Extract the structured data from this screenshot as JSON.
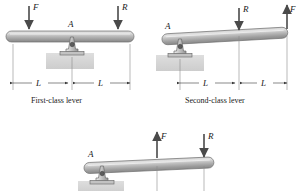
{
  "figure": {
    "colors": {
      "beam_light": "#d8d8d8",
      "beam_mid": "#b4b4b4",
      "beam_dark": "#8e8e8e",
      "ground": "#d9d9d9",
      "arrow": "#4a4a4a",
      "outline": "#5a5a5a",
      "text": "#1a1a1a"
    },
    "diagrams": [
      {
        "id": "first-class-lever",
        "caption": "First-class lever",
        "pivot_label": "A",
        "forces": [
          {
            "name": "F",
            "label": "F",
            "direction": "down",
            "position": "left-end"
          },
          {
            "name": "R",
            "label": "R",
            "direction": "down",
            "position": "right-end"
          }
        ],
        "dimensions": [
          {
            "label": "L",
            "from": "left-end",
            "to": "fulcrum"
          },
          {
            "label": "L",
            "from": "fulcrum",
            "to": "right-end"
          }
        ]
      },
      {
        "id": "second-class-lever",
        "caption": "Second-class lever",
        "pivot_label": "A",
        "forces": [
          {
            "name": "R",
            "label": "R",
            "direction": "down",
            "position": "middle"
          },
          {
            "name": "F",
            "label": "F",
            "direction": "up",
            "position": "right-end"
          }
        ],
        "dimensions": [
          {
            "label": "L",
            "from": "fulcrum",
            "to": "middle"
          },
          {
            "label": "L",
            "from": "middle",
            "to": "right-end"
          }
        ]
      },
      {
        "id": "third-class-lever",
        "caption": "",
        "pivot_label": "A",
        "forces": [
          {
            "name": "F",
            "label": "F",
            "direction": "up",
            "position": "middle"
          },
          {
            "name": "R",
            "label": "R",
            "direction": "down",
            "position": "right-end"
          }
        ],
        "dimensions": []
      }
    ]
  }
}
